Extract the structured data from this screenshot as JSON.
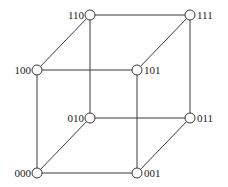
{
  "diagram": {
    "type": "cube-graph",
    "nodes": [
      {
        "id": "110",
        "label": "110",
        "x": 90,
        "y": 15,
        "label_side": "left"
      },
      {
        "id": "111",
        "label": "111",
        "x": 190,
        "y": 15,
        "label_side": "right"
      },
      {
        "id": "100",
        "label": "100",
        "x": 37,
        "y": 70,
        "label_side": "left"
      },
      {
        "id": "101",
        "label": "101",
        "x": 137,
        "y": 70,
        "label_side": "right"
      },
      {
        "id": "010",
        "label": "010",
        "x": 90,
        "y": 118,
        "label_side": "left"
      },
      {
        "id": "011",
        "label": "011",
        "x": 190,
        "y": 118,
        "label_side": "right"
      },
      {
        "id": "000",
        "label": "000",
        "x": 37,
        "y": 173,
        "label_side": "left"
      },
      {
        "id": "001",
        "label": "001",
        "x": 137,
        "y": 173,
        "label_side": "right"
      }
    ],
    "edges": [
      [
        "110",
        "111"
      ],
      [
        "110",
        "100"
      ],
      [
        "110",
        "010"
      ],
      [
        "111",
        "101"
      ],
      [
        "111",
        "011"
      ],
      [
        "100",
        "101"
      ],
      [
        "100",
        "000"
      ],
      [
        "101",
        "001"
      ],
      [
        "010",
        "011"
      ],
      [
        "010",
        "000"
      ],
      [
        "011",
        "001"
      ],
      [
        "000",
        "001"
      ]
    ]
  }
}
